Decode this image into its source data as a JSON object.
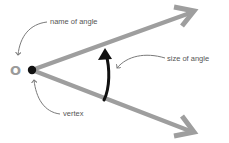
{
  "diagram": {
    "vertex_letter": "O",
    "labels": {
      "name": "name of angle",
      "size": "size of angle",
      "vertex": "vertex"
    },
    "colors": {
      "rays": "#9e9e9e",
      "arc_arrow": "#111111",
      "vertex_dot": "#111111",
      "callout": "#7a7a7a",
      "label_text": "#555555",
      "vertex_letter": "#9a9a9a"
    }
  }
}
